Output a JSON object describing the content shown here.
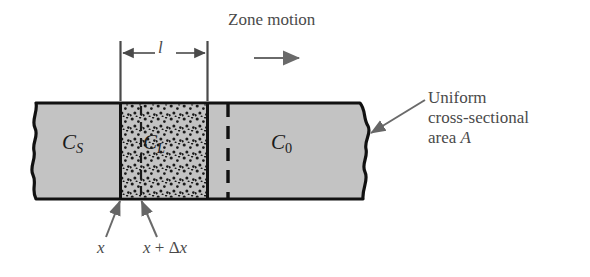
{
  "figure": {
    "kind": "zone-refining-schematic",
    "width": 590,
    "height": 277,
    "background_color": "#ffffff",
    "bar_fill_color": "#c3c3c3",
    "bar_outline_color": "#111111",
    "stipple_dot_color": "#1a1a1a",
    "annotation_color": "#4a4a4a",
    "label_color": "#1a1a1a"
  },
  "labels": {
    "zone_motion": "Zone motion",
    "zone_length": "l",
    "solid_concentration": "C",
    "solid_concentration_sub": "S",
    "liquid_concentration": "C",
    "liquid_concentration_sub": "L",
    "initial_concentration": "C",
    "initial_concentration_sub": "0",
    "uniform_line1": "Uniform",
    "uniform_line2": "cross-sectional",
    "uniform_line3_prefix": "area ",
    "uniform_line3_symbol": "A",
    "position_x": "x",
    "position_x_plus_dx_prefix": "x",
    "position_x_plus_dx_operator": " + ",
    "position_x_plus_dx_delta": "Δ",
    "position_x_plus_dx_suffix": "x"
  },
  "regions": {
    "solid_left": {
      "name": "solid region left of molten zone",
      "label": "C_S",
      "x_start": 32,
      "x_end": 120
    },
    "molten_zone": {
      "name": "molten (liquid) zone, stippled",
      "label": "C_L",
      "x_start": 120,
      "x_end": 208,
      "length_label": "l"
    },
    "unmelted_right": {
      "name": "unmelted bar of initial composition",
      "label": "C_0",
      "x_start": 208,
      "x_end": 370
    }
  },
  "markers": {
    "slice_left_boundary": {
      "label": "x",
      "x": 120
    },
    "slice_right_boundary": {
      "label": "x + Δx",
      "x": 141
    },
    "previous_zone_edge": {
      "label": "dashed zone trailing edge",
      "x": 228
    }
  },
  "arrows": {
    "zone_motion_direction": "right",
    "zone_motion_arrow": {
      "x_start": 254,
      "x_end": 301,
      "y": 58
    },
    "callout_to_bar_edge": {
      "from_x": 425,
      "from_y": 100,
      "to_x": 369,
      "to_y": 134
    },
    "pointer_to_x": {
      "from_x": 108,
      "from_y": 235,
      "to_x": 120,
      "to_y": 199
    },
    "pointer_to_x_plus_dx": {
      "from_x": 158,
      "from_y": 235,
      "to_x": 141,
      "to_y": 199
    }
  },
  "geometry": {
    "bar_top_y": 103,
    "bar_bottom_y": 199,
    "dimension_line_y": 53,
    "extension_line_top_y": 41,
    "extension_line_bottom_y": 101
  }
}
